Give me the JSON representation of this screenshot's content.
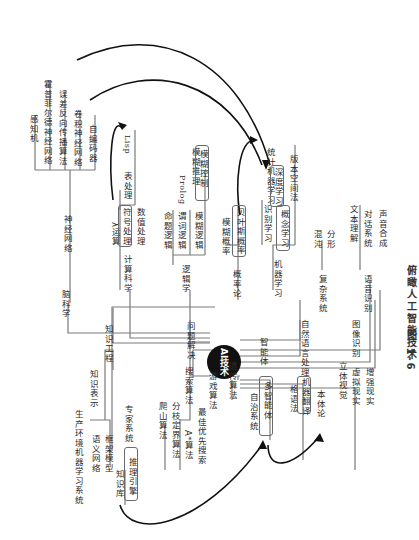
{
  "caption": {
    "figure": "图 1-6",
    "title": "俯瞰人工智能技术"
  },
  "center": {
    "label": "AI技术"
  },
  "branches": {
    "brain_science": {
      "label": "脑科学",
      "children": {
        "neural_network": {
          "label": "神经网络",
          "items": [
            "感知机",
            "霍普菲尔德神经网络",
            "误差反向传播算法",
            "卷积神经网络",
            "自编码器"
          ]
        }
      }
    },
    "computer_science": {
      "label": "计算科学",
      "items": [
        "λ运算",
        "符号处理",
        "数值处理"
      ],
      "sub": {
        "label": "表处理",
        "lang": "Lisp"
      }
    },
    "logic": {
      "label": "逻辑学",
      "items": [
        "命题逻辑",
        "谓词逻辑",
        "模糊逻辑"
      ],
      "prolog": "Prolog",
      "fuzzy": [
        "模糊推理",
        "模糊控制"
      ]
    },
    "probability": {
      "label": "概率论",
      "items": [
        "模糊概率",
        "贝叶斯概率"
      ]
    },
    "machine_learning": {
      "label": "机器学习",
      "items": [
        "识别学习",
        "概念学习"
      ],
      "statistical": {
        "label": "统计机器学习",
        "items": [
          "深度学习",
          "版本空间法"
        ]
      }
    },
    "complex_systems": {
      "label": "复杂系统",
      "items": [
        "混沌",
        "分形"
      ]
    },
    "speech_recognition": {
      "label": "语音识别",
      "items": [
        "文本理解",
        "对话系统",
        "声音合成"
      ]
    },
    "knowledge_engineering": {
      "label": "知识工程",
      "knowledge_repr": {
        "label": "知识表示",
        "items": [
          "生产环境机器学习系统",
          "语义网络",
          "框架模型"
        ]
      },
      "expert_system": {
        "label": "专家系统",
        "items": [
          "知识库",
          "推理引擎"
        ]
      }
    },
    "problem_solving": {
      "label": "问题解决",
      "search": {
        "label": "搜索算法",
        "items": [
          "爬山算法",
          "分枝定界算法",
          "A*算法",
          "最佳优先搜索"
        ]
      },
      "game": "游戏算法",
      "genetic": "遗传算法"
    },
    "agent": {
      "label": "智能体",
      "items": [
        "自治系统",
        "多智能体"
      ]
    },
    "nlp": {
      "label": "自然语言处理",
      "items": [
        "格语法",
        "机器翻译",
        "本体论"
      ]
    },
    "image_recognition": {
      "label": "图像识别",
      "items": [
        "立体视觉",
        "虚拟现实",
        "增强现实"
      ]
    }
  },
  "colors": {
    "line": "#7a7a7a",
    "hub": "#111111",
    "arrow": "#111111",
    "text": "#2a2a2a"
  }
}
